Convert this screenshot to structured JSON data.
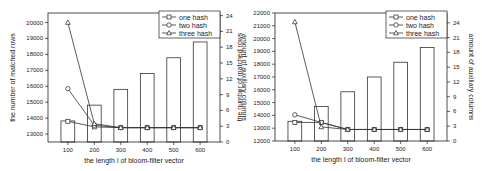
{
  "chart_data": [
    {
      "type": "bar",
      "title": "",
      "categories": [
        "100",
        "200",
        "300",
        "400",
        "500",
        "600"
      ],
      "xlabel": "the length l of bloom-filter vector",
      "ylabel": "the number of matched rows",
      "y2label": "amount of auxiliary columns",
      "ylim": [
        12500,
        20600
      ],
      "y_ticks": [
        13000,
        14000,
        15000,
        16000,
        17000,
        18000,
        19000,
        20000
      ],
      "y2lim": [
        0,
        24.5
      ],
      "y2_ticks": [
        0,
        3,
        6,
        9,
        12,
        15,
        18,
        21,
        24
      ],
      "bars": {
        "name": "auxiliary columns",
        "axis": "right",
        "values": [
          4,
          7,
          10,
          13,
          16,
          19
        ]
      },
      "series": [
        {
          "name": "one hash",
          "marker": "square",
          "axis": "left",
          "values": [
            13800,
            13450,
            13400,
            13400,
            13400,
            13400
          ]
        },
        {
          "name": "two hash",
          "marker": "circle",
          "axis": "left",
          "values": [
            15850,
            13550,
            13400,
            13400,
            13400,
            13400
          ]
        },
        {
          "name": "three hash",
          "marker": "triangle",
          "axis": "left",
          "values": [
            20000,
            13650,
            13400,
            13400,
            13400,
            13400
          ]
        }
      ],
      "legend": {
        "position": "top-right",
        "entries": [
          "one hash",
          "two hash",
          "three hash"
        ]
      },
      "grid": false
    },
    {
      "type": "bar",
      "title": "",
      "categories": [
        "100",
        "200",
        "300",
        "400",
        "500",
        "600"
      ],
      "xlabel": "the length l of bloom-filter vector",
      "ylabel": "the number of matched rows",
      "y2label": "amount of auxiliary columns",
      "ylim": [
        12000,
        22000
      ],
      "y_ticks": [
        12000,
        13000,
        14000,
        15000,
        16000,
        17000,
        18000,
        19000,
        20000,
        21000,
        22000
      ],
      "y2lim": [
        0,
        26
      ],
      "y2_ticks": [
        0,
        3,
        6,
        9,
        12,
        15,
        18,
        21,
        24
      ],
      "bars": {
        "name": "auxiliary columns",
        "axis": "right",
        "values": [
          4,
          7,
          10,
          13,
          16,
          19
        ]
      },
      "series": [
        {
          "name": "one hash",
          "marker": "square",
          "axis": "left",
          "values": [
            13450,
            13450,
            12900,
            12900,
            12900,
            12900
          ]
        },
        {
          "name": "two hash",
          "marker": "circle",
          "axis": "left",
          "values": [
            14050,
            13450,
            12900,
            12900,
            12900,
            12900
          ]
        },
        {
          "name": "three hash",
          "marker": "triangle",
          "axis": "left",
          "values": [
            21300,
            13100,
            12900,
            12900,
            12900,
            12900
          ]
        }
      ],
      "legend": {
        "position": "top-right",
        "entries": [
          "one hash",
          "two hash",
          "three hash"
        ]
      },
      "grid": false
    }
  ]
}
